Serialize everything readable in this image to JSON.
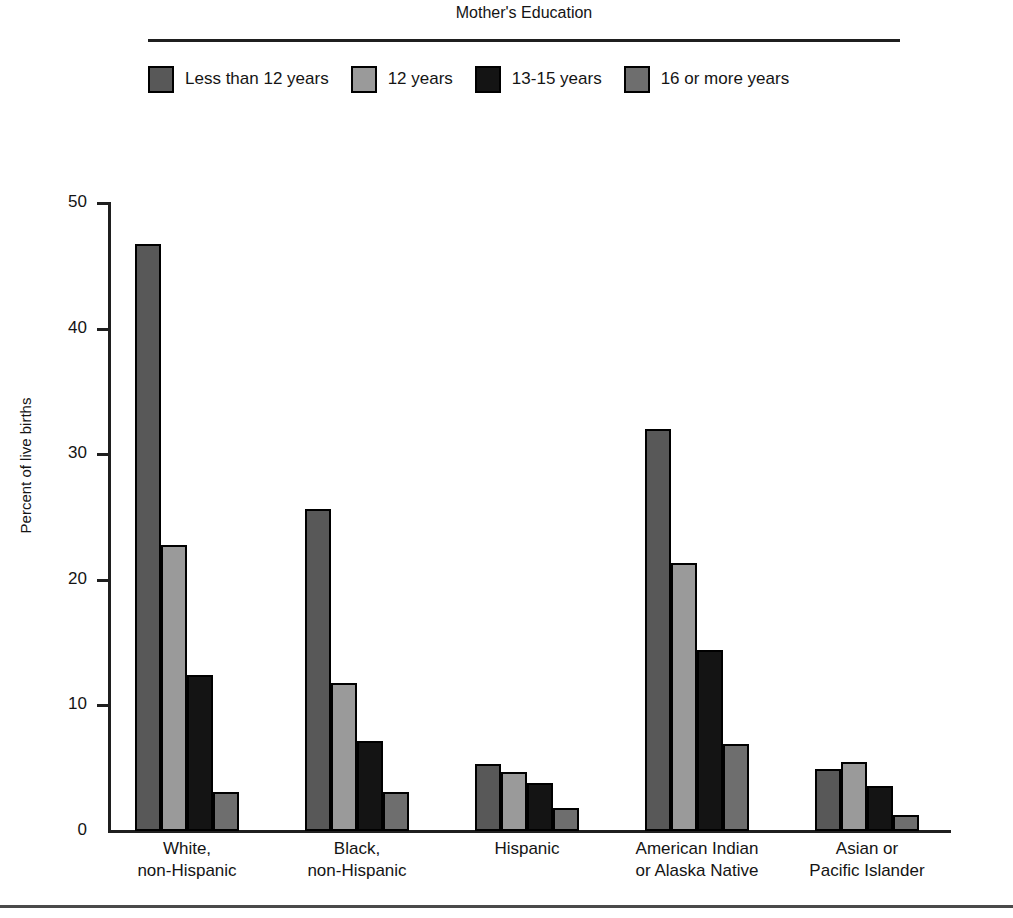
{
  "legend": {
    "title": "Mother's Education",
    "items": [
      {
        "label": "Less than 12 years",
        "color": "#585858",
        "swatch_name": "legend-swatch-less-than-12-years"
      },
      {
        "label": "12 years",
        "color": "#9a9a9a",
        "swatch_name": "legend-swatch-12-years"
      },
      {
        "label": "13-15 years",
        "color": "#141414",
        "swatch_name": "legend-swatch-13-15-years"
      },
      {
        "label": "16 or more years",
        "color": "#6e6e6e",
        "swatch_name": "legend-swatch-16-or-more-years"
      }
    ]
  },
  "axes": {
    "y_title": "Percent of live births",
    "y_ticks": [
      "0",
      "10",
      "20",
      "30",
      "40",
      "50"
    ]
  },
  "chart_data": {
    "type": "bar",
    "title": "Mother's Education",
    "xlabel": "",
    "ylabel": "Percent of live births",
    "ylim": [
      0,
      50
    ],
    "yticks": [
      0,
      10,
      20,
      30,
      40,
      50
    ],
    "grid": false,
    "legend_position": "top",
    "categories": [
      "White,\nnon-Hispanic",
      "Black,\nnon-Hispanic",
      "Hispanic",
      "American Indian\nor Alaska Native",
      "Asian or\nPacific Islander"
    ],
    "category_lines": [
      [
        "White,",
        "non-Hispanic"
      ],
      [
        "Black,",
        "non-Hispanic"
      ],
      [
        "Hispanic",
        ""
      ],
      [
        "American Indian",
        "or Alaska Native"
      ],
      [
        "Asian or",
        "Pacific Islander"
      ]
    ],
    "series": [
      {
        "name": "Less than 12 years",
        "color": "#585858",
        "values": [
          46.7,
          25.6,
          5.3,
          32.0,
          4.9
        ]
      },
      {
        "name": "12 years",
        "color": "#9a9a9a",
        "values": [
          22.8,
          11.8,
          4.7,
          21.3,
          5.5
        ]
      },
      {
        "name": "13-15 years",
        "color": "#141414",
        "values": [
          12.4,
          7.2,
          3.8,
          14.4,
          3.6
        ]
      },
      {
        "name": "16 or more years",
        "color": "#6e6e6e",
        "values": [
          3.1,
          3.1,
          1.8,
          6.9,
          1.3
        ]
      }
    ]
  }
}
